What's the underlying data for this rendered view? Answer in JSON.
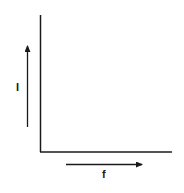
{
  "diagram": {
    "type": "blank-axes",
    "y_axis": {
      "label": "I",
      "arrow_direction": "up"
    },
    "x_axis": {
      "label": "f",
      "arrow_direction": "right"
    },
    "colors": {
      "line": "#1a1a1a",
      "background": "#ffffff"
    }
  }
}
